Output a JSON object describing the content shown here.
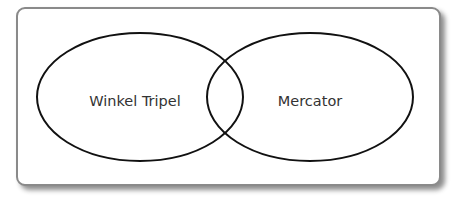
{
  "diagram": {
    "type": "venn",
    "sets": [
      {
        "label": "Winkel Tripel",
        "cx": 140,
        "cy": 97,
        "rx": 103,
        "ry": 64
      },
      {
        "label": "Mercator",
        "cx": 310,
        "cy": 97,
        "rx": 103,
        "ry": 64
      }
    ],
    "colors": {
      "stroke": "#111111",
      "text": "#333333",
      "frame_border": "#8a8a8a",
      "background": "#ffffff"
    }
  }
}
